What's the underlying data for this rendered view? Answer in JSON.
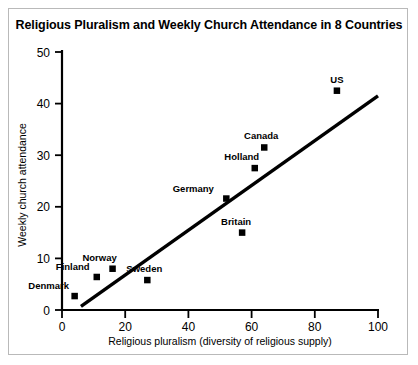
{
  "chart_data": {
    "type": "scatter",
    "title": "Religious Pluralism and Weekly Church Attendance in 8 Countries",
    "xlabel": "Religious pluralism (diversity of religious supply)",
    "ylabel": "Weekly church attendance",
    "xlim": [
      0,
      100
    ],
    "ylim": [
      0,
      50
    ],
    "xticks": [
      0,
      20,
      40,
      60,
      80,
      100
    ],
    "yticks": [
      0,
      10,
      20,
      30,
      40,
      50
    ],
    "xtick_labels": [
      "0",
      "20",
      "40",
      "60",
      "80",
      "100"
    ],
    "ytick_labels": [
      "0",
      "10",
      "20",
      "30",
      "40",
      "50"
    ],
    "grid": false,
    "legend": false,
    "marker": "square",
    "marker_color": "#000000",
    "points": [
      {
        "label": "Denmark",
        "x": 4,
        "y": 2.7,
        "label_dx": -26,
        "label_dy": -7
      },
      {
        "label": "Finland",
        "x": 11,
        "y": 6.4,
        "label_dx": -24,
        "label_dy": -7
      },
      {
        "label": "Norway",
        "x": 16,
        "y": 8.0,
        "label_dx": -13,
        "label_dy": -8
      },
      {
        "label": "Sweden",
        "x": 27,
        "y": 5.8,
        "label_dx": -3,
        "label_dy": -8
      },
      {
        "label": "Germany",
        "x": 52,
        "y": 21.6,
        "label_dx": -33,
        "label_dy": -7
      },
      {
        "label": "Britain",
        "x": 57,
        "y": 15.0,
        "label_dx": -6,
        "label_dy": -8
      },
      {
        "label": "Holland",
        "x": 61,
        "y": 27.5,
        "label_dx": -13,
        "label_dy": -8
      },
      {
        "label": "Canada",
        "x": 64,
        "y": 31.5,
        "label_dx": -3,
        "label_dy": -8
      },
      {
        "label": "US",
        "x": 87,
        "y": 42.5,
        "label_dx": 0,
        "label_dy": -8
      }
    ],
    "trend_line": {
      "name": "fit-line",
      "x1": 6,
      "y1": 0.7,
      "x2": 100,
      "y2": 41.5,
      "color": "#000000"
    }
  }
}
